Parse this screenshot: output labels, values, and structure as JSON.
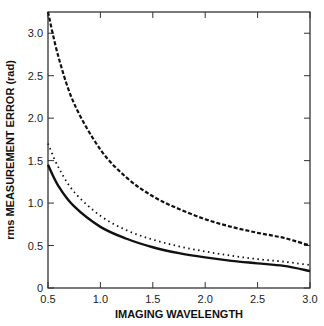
{
  "chart_data": {
    "type": "line",
    "title": "",
    "xlabel": "IMAGING WAVELENGTH",
    "ylabel": "rms MEASUREMENT ERROR (rad)",
    "xlim": [
      0.5,
      3.0
    ],
    "ylim": [
      0,
      3.25
    ],
    "xticks": [
      0.5,
      1.0,
      1.5,
      2.0,
      2.5,
      3.0
    ],
    "xtick_labels": [
      "0.5",
      "1.0",
      "1.5",
      "2.0",
      "2.5",
      "3.0"
    ],
    "yticks": [
      0,
      0.5,
      1.0,
      1.5,
      2.0,
      2.5,
      3.0
    ],
    "ytick_labels": [
      "0",
      "0.5",
      "1.0",
      "1.5",
      "2.0",
      "2.5",
      "3.0"
    ],
    "grid": false,
    "legend": null,
    "x": [
      0.5,
      0.6,
      0.75,
      1.0,
      1.25,
      1.5,
      1.75,
      2.0,
      2.25,
      2.5,
      2.75,
      3.0
    ],
    "series": [
      {
        "name": "dashed",
        "style": "dashed",
        "values": [
          3.25,
          2.72,
          2.17,
          1.63,
          1.3,
          1.08,
          0.93,
          0.81,
          0.72,
          0.65,
          0.59,
          0.5
        ]
      },
      {
        "name": "dotted",
        "style": "dotted",
        "values": [
          1.7,
          1.42,
          1.13,
          0.85,
          0.68,
          0.57,
          0.49,
          0.43,
          0.38,
          0.34,
          0.31,
          0.27
        ]
      },
      {
        "name": "solid",
        "style": "solid",
        "values": [
          1.45,
          1.2,
          0.96,
          0.72,
          0.58,
          0.48,
          0.41,
          0.36,
          0.32,
          0.29,
          0.26,
          0.2
        ]
      }
    ]
  }
}
